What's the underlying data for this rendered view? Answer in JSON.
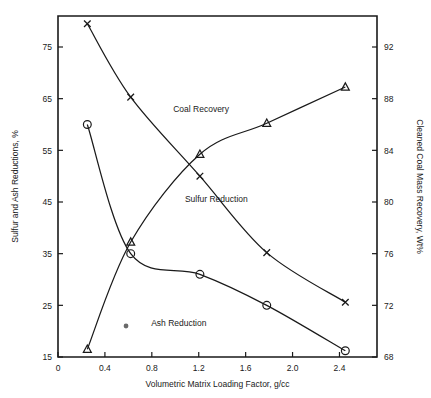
{
  "chart_data": {
    "type": "line",
    "title": "",
    "xlabel": "Volumetric Matrix Loading Factor, g/cc",
    "ylabel": "Sulfur and Ash Reductions, %",
    "y2label": "Cleaned Coal Mass Recovery, Wt%",
    "xlim": [
      0,
      2.72
    ],
    "ylim": [
      15,
      81
    ],
    "y2lim": [
      68,
      94.4
    ],
    "grid": false,
    "legend_position": "inline-annotations",
    "xticks": [
      "0",
      "0.4",
      "0.8",
      "1.2",
      "1.6",
      "2.0",
      "2.4"
    ],
    "xtickvals": [
      0,
      0.4,
      0.8,
      1.2,
      1.6,
      2.0,
      2.4
    ],
    "yticks": [
      "15",
      "25",
      "35",
      "45",
      "55",
      "65",
      "75"
    ],
    "ytickvals": [
      15,
      25,
      35,
      45,
      55,
      65,
      75
    ],
    "y2ticks": [
      "68",
      "72",
      "76",
      "80",
      "84",
      "88",
      "92"
    ],
    "y2tickvals": [
      68,
      72,
      76,
      80,
      84,
      88,
      92
    ],
    "series": [
      {
        "name": "Coal Recovery",
        "marker": "triangle",
        "axis": "right",
        "label_x": 1.22,
        "label_y": 87.0,
        "x": [
          0.25,
          0.62,
          1.21,
          1.78,
          2.45
        ],
        "values": [
          68.6,
          76.9,
          83.7,
          86.1,
          88.9
        ]
      },
      {
        "name": "Sulfur Reduction",
        "marker": "cross",
        "axis": "left",
        "label_x": 1.35,
        "label_y": 45.0,
        "x": [
          0.25,
          0.62,
          1.21,
          1.78,
          2.45
        ],
        "values": [
          79.5,
          65.3,
          50.0,
          35.2,
          25.6
        ]
      },
      {
        "name": "Ash Reduction",
        "marker": "circle",
        "axis": "left",
        "label_x": 1.03,
        "label_y": 21.0,
        "x": [
          0.25,
          0.62,
          1.21,
          1.78,
          2.45
        ],
        "values": [
          60.0,
          35.0,
          31.0,
          25.0,
          16.2
        ]
      }
    ],
    "stray_points": [
      {
        "marker": "dot",
        "axis": "left",
        "x": 0.58,
        "value": 21.0
      }
    ]
  }
}
